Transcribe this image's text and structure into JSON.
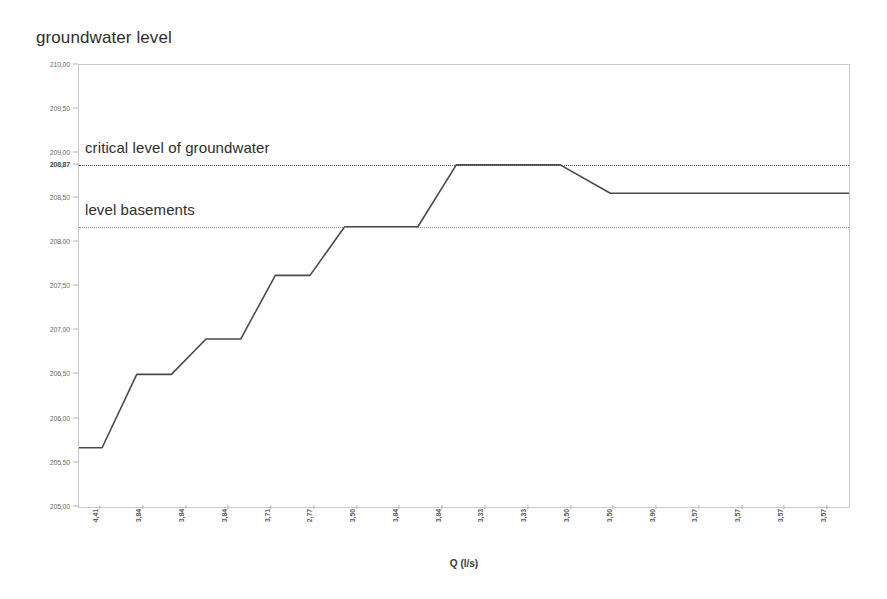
{
  "chart_data": {
    "type": "line",
    "title": "groundwater level",
    "xlabel": "Q (l/s)",
    "ylabel": "groundwater level",
    "ylim": [
      205.0,
      210.0
    ],
    "grid": false,
    "legend": null,
    "y_ticks": [
      {
        "value": 210.0,
        "label": "210,00",
        "highlight": false
      },
      {
        "value": 209.5,
        "label": "209,50",
        "highlight": false
      },
      {
        "value": 209.0,
        "label": "209,00",
        "highlight": false
      },
      {
        "value": 208.87,
        "label": "208,87",
        "highlight": true
      },
      {
        "value": 208.5,
        "label": "208,50",
        "highlight": false
      },
      {
        "value": 208.0,
        "label": "208,00",
        "highlight": false
      },
      {
        "value": 207.5,
        "label": "207,50",
        "highlight": false
      },
      {
        "value": 207.0,
        "label": "207,00",
        "highlight": false
      },
      {
        "value": 206.5,
        "label": "206,50",
        "highlight": false
      },
      {
        "value": 206.0,
        "label": "206,00",
        "highlight": false
      },
      {
        "value": 205.5,
        "label": "205,50",
        "highlight": false
      },
      {
        "value": 205.0,
        "label": "205,00",
        "highlight": false
      }
    ],
    "x_tick_labels": [
      "4,41",
      "3,84",
      "3,84",
      "3,84",
      "3,71",
      "2,77",
      "3,50",
      "3,84",
      "3,84",
      "3,33",
      "3,33",
      "3,50",
      "3,50",
      "3,90",
      "3,57",
      "3,57",
      "3,57",
      "3,57"
    ],
    "reference_lines": [
      {
        "name": "critical level of groundwater",
        "value": 208.87,
        "label": "critical level of groundwater",
        "style": "dotted",
        "emphasis": "strong"
      },
      {
        "name": "level basements",
        "value": 208.17,
        "label": "level basements",
        "style": "dotted",
        "emphasis": "faint"
      }
    ],
    "series": [
      {
        "name": "groundwater level",
        "color": "#4a4a4a",
        "x": [
          0.0,
          0.03,
          0.075,
          0.12,
          0.165,
          0.21,
          0.255,
          0.3,
          0.345,
          0.395,
          0.44,
          0.49,
          0.535,
          0.58,
          0.625,
          0.69,
          0.74,
          1.0
        ],
        "values": [
          205.67,
          205.67,
          206.5,
          206.5,
          206.9,
          206.9,
          207.62,
          207.62,
          208.17,
          208.17,
          208.17,
          208.87,
          208.87,
          208.87,
          208.87,
          208.55,
          208.55,
          208.55
        ]
      }
    ],
    "plateaus": [
      {
        "level": 205.67,
        "note": "initial steady level"
      },
      {
        "level": 206.5,
        "note": "step 1"
      },
      {
        "level": 206.9,
        "note": "step 2"
      },
      {
        "level": 207.62,
        "note": "step 3"
      },
      {
        "level": 208.17,
        "note": "step 4 - at level basements"
      },
      {
        "level": 208.87,
        "note": "step 5 - at critical level of groundwater"
      },
      {
        "level": 208.55,
        "note": "final drawdown level"
      }
    ]
  }
}
